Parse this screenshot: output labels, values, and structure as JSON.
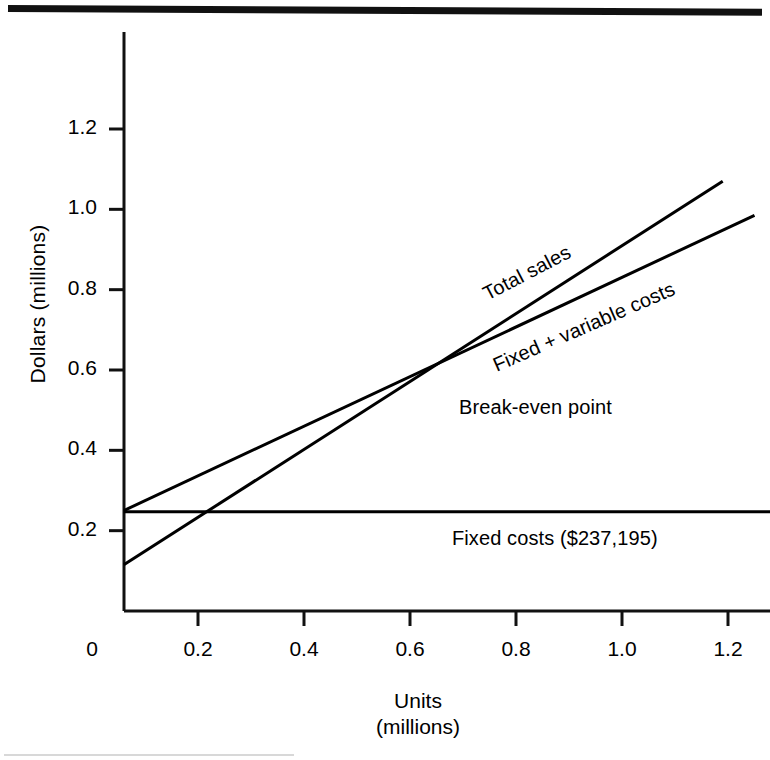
{
  "figure": {
    "top_rule": "horizontal-rule",
    "bottom_rule": "horizontal-rule"
  },
  "axes": {
    "y_title": "Dollars (millions)",
    "x_title_line1": "Units",
    "x_title_line2": "(millions)",
    "y_ticks": [
      "0.2",
      "0.4",
      "0.6",
      "0.8",
      "1.0",
      "1.2"
    ],
    "x_ticks": [
      "0",
      "0.2",
      "0.4",
      "0.6",
      "0.8",
      "1.0",
      "1.2"
    ]
  },
  "annotations": {
    "total_sales": "Total sales",
    "fixed_variable": "Fixed  +  variable costs",
    "breakeven": "Break-even point",
    "fixed_costs": "Fixed costs ($237,195)"
  },
  "chart_data": {
    "type": "line",
    "title": "",
    "xlabel": "Units (millions)",
    "ylabel": "Dollars (millions)",
    "xlim": [
      0,
      1.32
    ],
    "ylim": [
      0,
      1.42
    ],
    "xticks": [
      0,
      0.2,
      0.4,
      0.6,
      0.8,
      1.0,
      1.2
    ],
    "yticks": [
      0.2,
      0.4,
      0.6,
      0.8,
      1.0,
      1.2
    ],
    "grid": false,
    "legend": "inline-annotations",
    "fixed_costs_value": 237195,
    "breakeven": {
      "x": 0.645,
      "y": 0.645
    },
    "series": [
      {
        "name": "Total sales",
        "x": [
          0.06,
          1.19
        ],
        "y": [
          0.115,
          1.07
        ],
        "color": "#000000"
      },
      {
        "name": "Fixed + variable costs",
        "x": [
          0.06,
          1.25
        ],
        "y": [
          0.25,
          0.985
        ],
        "color": "#000000"
      },
      {
        "name": "Fixed costs",
        "x": [
          0.06,
          1.32
        ],
        "y": [
          0.247,
          0.247
        ],
        "color": "#000000"
      }
    ]
  }
}
